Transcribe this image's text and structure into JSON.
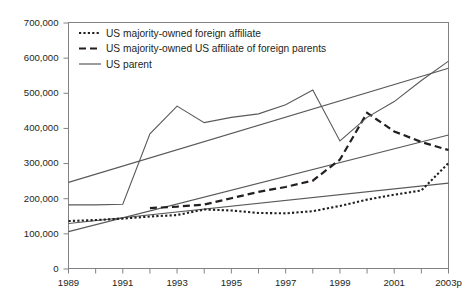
{
  "chart_data": {
    "type": "line",
    "title": "",
    "subtitle": "",
    "xlabel": "",
    "ylabel": "",
    "grid": false,
    "legend_position": "top-left",
    "x": [
      1989,
      1990,
      1991,
      1992,
      1993,
      1994,
      1995,
      1996,
      1997,
      1998,
      1999,
      2000,
      2001,
      2002,
      2003
    ],
    "xtick_labels": [
      "1989",
      "",
      "1991",
      "",
      "1993",
      "",
      "1995",
      "",
      "1997",
      "",
      "1999",
      "",
      "2001",
      "",
      "2003p"
    ],
    "xtick_labels_shown": [
      "1989",
      "1991",
      "1993",
      "1995",
      "1997",
      "1999",
      "2001",
      "2003p"
    ],
    "xlim": [
      1989,
      2003
    ],
    "ylim": [
      0,
      700000
    ],
    "ytick_values": [
      0,
      100000,
      200000,
      300000,
      400000,
      500000,
      600000,
      700000
    ],
    "ytick_labels": [
      "0",
      "100,000",
      "200,000",
      "300,000",
      "400,000",
      "500,000",
      "600,000",
      "700,000"
    ],
    "series": [
      {
        "name": "US majority-owned foreign affiliate",
        "style": "dotted",
        "color": "#231f20",
        "values": [
          135000,
          138000,
          142000,
          148000,
          152000,
          168000,
          165000,
          158000,
          157000,
          163000,
          178000,
          196000,
          210000,
          222000,
          300000
        ]
      },
      {
        "name": "US majority-owned US affiliate of foreign parents",
        "style": "dashed",
        "color": "#231f20",
        "values": [
          null,
          null,
          null,
          172000,
          176000,
          182000,
          200000,
          218000,
          232000,
          250000,
          310000,
          443000,
          390000,
          360000,
          337000
        ]
      },
      {
        "name": "US parent",
        "style": "solid",
        "color": "#58595b",
        "values": [
          181000,
          181000,
          183000,
          383000,
          462000,
          415000,
          430000,
          440000,
          466000,
          508000,
          363000,
          430000,
          475000,
          535000,
          590000
        ]
      }
    ],
    "trend_lines": [
      {
        "name": "upper-trend",
        "style": "solid",
        "color": "#58595b",
        "from": {
          "x": 1989,
          "y": 245000
        },
        "to": {
          "x": 2003,
          "y": 570000
        }
      },
      {
        "name": "middle-trend",
        "style": "solid",
        "color": "#58595b",
        "from": {
          "x": 1989,
          "y": 105000
        },
        "to": {
          "x": 2003,
          "y": 380000
        }
      },
      {
        "name": "lower-trend",
        "style": "solid",
        "color": "#58595b",
        "from": {
          "x": 1989,
          "y": 128000
        },
        "to": {
          "x": 2003,
          "y": 243000
        }
      }
    ]
  },
  "legend": {
    "items": [
      {
        "label": "US majority-owned foreign affiliate",
        "style": "dotted"
      },
      {
        "label": "US majority-owned US affiliate of foreign parents",
        "style": "dashed"
      },
      {
        "label": "US parent",
        "style": "solid"
      }
    ]
  }
}
